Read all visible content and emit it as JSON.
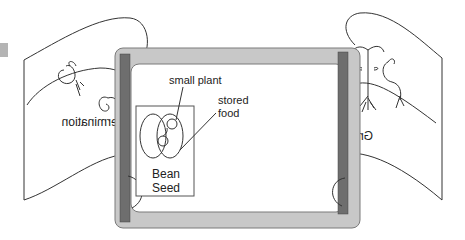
{
  "diagram": {
    "labels": {
      "small_plant": "small plant",
      "stored_food_line1": "stored",
      "stored_food_line2": "food",
      "bean_line1": "Bean",
      "seed_line1": "Seed",
      "germination": "Germination",
      "growth": "Growth"
    },
    "colors": {
      "frame_fill": "#c8c8c8",
      "frame_stroke": "#7a7a7a",
      "bar_fill": "#6e6e6e",
      "screen_fill": "#ffffff",
      "marker_fill": "#b4b4b4",
      "line": "#333333"
    }
  }
}
